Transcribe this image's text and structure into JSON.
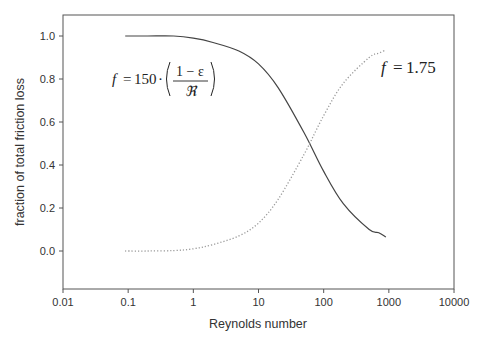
{
  "chart_data": {
    "type": "line",
    "title": "",
    "xlabel": "Reynolds number",
    "ylabel": "fraction of total friction loss",
    "xscale": "log",
    "xlim": [
      0.01,
      10000
    ],
    "ylim": [
      -0.18,
      1.1
    ],
    "x_ticks": [
      "0.01",
      "0.1",
      "1",
      "10",
      "100",
      "1000",
      "10000"
    ],
    "x_tick_values": [
      0.01,
      0.1,
      1,
      10,
      100,
      1000,
      10000
    ],
    "y_ticks": [
      "0.0",
      "0.2",
      "0.4",
      "0.6",
      "0.8",
      "1.0"
    ],
    "y_tick_values": [
      0.0,
      0.2,
      0.4,
      0.6,
      0.8,
      1.0
    ],
    "grid": false,
    "legend": null,
    "series": [
      {
        "name": "viscous term",
        "style": "solid",
        "color": "#444444",
        "x": [
          0.09,
          0.2,
          0.5,
          1,
          2,
          5,
          10,
          20,
          50,
          100,
          200,
          500,
          700,
          900
        ],
        "values": [
          1.0,
          1.0,
          1.0,
          0.99,
          0.97,
          0.93,
          0.87,
          0.76,
          0.55,
          0.37,
          0.22,
          0.1,
          0.085,
          0.065
        ]
      },
      {
        "name": "inertial term",
        "style": "dotted",
        "color": "#999999",
        "x": [
          0.09,
          0.2,
          0.5,
          1,
          2,
          5,
          10,
          20,
          50,
          100,
          200,
          500,
          700,
          900
        ],
        "values": [
          0.0,
          0.0,
          0.002,
          0.01,
          0.03,
          0.07,
          0.13,
          0.24,
          0.45,
          0.63,
          0.78,
          0.9,
          0.92,
          0.935
        ]
      }
    ],
    "annotations": [
      {
        "text": "f = 150 · ((1 − ε) / ℜ)",
        "position": "upper-left",
        "applies_to": "solid"
      },
      {
        "text": "f = 1.75",
        "position": "upper-right",
        "applies_to": "dotted"
      }
    ]
  },
  "annotations": {
    "viscous": {
      "f": "f",
      "eq": "=",
      "coef": "150",
      "dot": "·",
      "num": "1 − ε",
      "den": "ℜ"
    },
    "inertial": {
      "f": "f",
      "eq": "=",
      "value": "1.75"
    }
  }
}
